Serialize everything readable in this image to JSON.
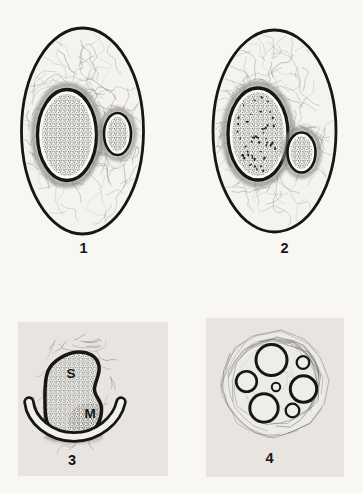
{
  "figure": {
    "panels": [
      {
        "number": "1"
      },
      {
        "number": "2"
      },
      {
        "number": "3",
        "labels": {
          "S": "S",
          "M": "M"
        }
      },
      {
        "number": "4"
      }
    ],
    "colors": {
      "ink": "#161616",
      "page_bg": "#f8f7f4",
      "panel_bg": "#e8e5e0",
      "ellipse_fill": "#f4f3ef",
      "fiber": "#6b6b6b",
      "halo": "#8f8c86",
      "stipple": "#2e2c2a"
    }
  }
}
